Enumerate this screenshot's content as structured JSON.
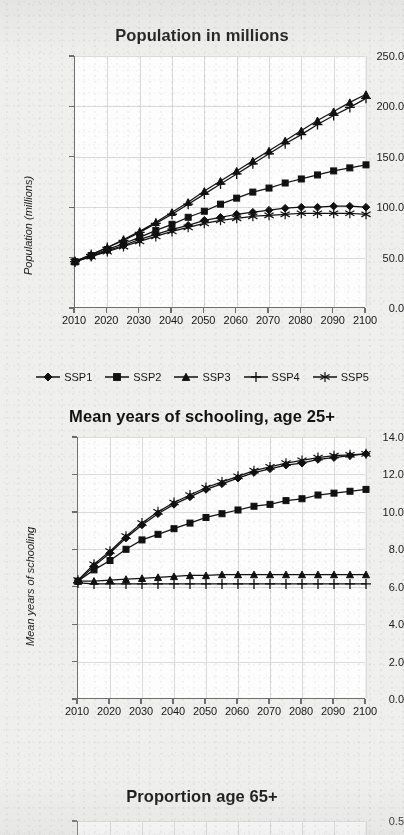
{
  "page": {
    "background_color": "#efefee",
    "panel_color": "#fdfdfd",
    "ink_color": "#111111",
    "grid_color": "#d9d9d9"
  },
  "legend": {
    "items": [
      {
        "label": "SSP1",
        "marker": "diamond"
      },
      {
        "label": "SSP2",
        "marker": "square"
      },
      {
        "label": "SSP3",
        "marker": "triangle"
      },
      {
        "label": "SSP4",
        "marker": "plus"
      },
      {
        "label": "SSP5",
        "marker": "asterisk"
      }
    ]
  },
  "chart_data": [
    {
      "type": "line",
      "title": "Population in millions",
      "xlabel": "",
      "ylabel": "Population (millions)",
      "x": [
        2010,
        2015,
        2020,
        2025,
        2030,
        2035,
        2040,
        2045,
        2050,
        2055,
        2060,
        2065,
        2070,
        2075,
        2080,
        2085,
        2090,
        2095,
        2100
      ],
      "xticklabels": [
        "2010",
        "2020",
        "2030",
        "2040",
        "2050",
        "2060",
        "2070",
        "2080",
        "2090",
        "2100"
      ],
      "xlim": [
        2010,
        2100
      ],
      "ylim": [
        0,
        250
      ],
      "yticklabels": [
        "0.0",
        "50.0",
        "100.0",
        "150.0",
        "200.0",
        "250.0"
      ],
      "yticks": [
        0,
        50,
        100,
        150,
        200,
        250
      ],
      "grid": true,
      "legend_position": "below",
      "series": [
        {
          "name": "SSP1",
          "marker": "diamond",
          "values": [
            46,
            51,
            57,
            62,
            68,
            73,
            78,
            82,
            87,
            90,
            93,
            95,
            97,
            99,
            100,
            100,
            101,
            101,
            100
          ]
        },
        {
          "name": "SSP2",
          "marker": "square",
          "values": [
            46,
            52,
            58,
            64,
            70,
            77,
            83,
            90,
            96,
            103,
            109,
            115,
            119,
            124,
            128,
            132,
            136,
            139,
            142
          ]
        },
        {
          "name": "SSP3",
          "marker": "triangle",
          "values": [
            46,
            53,
            60,
            68,
            76,
            85,
            95,
            105,
            116,
            126,
            136,
            146,
            156,
            166,
            176,
            186,
            195,
            204,
            212
          ]
        },
        {
          "name": "SSP4",
          "marker": "plus",
          "values": [
            46,
            53,
            60,
            67,
            75,
            84,
            93,
            103,
            113,
            123,
            133,
            143,
            153,
            163,
            172,
            182,
            191,
            199,
            208
          ]
        },
        {
          "name": "SSP5",
          "marker": "asterisk",
          "values": [
            46,
            51,
            56,
            61,
            66,
            71,
            76,
            80,
            84,
            87,
            89,
            91,
            92,
            93,
            94,
            94,
            94,
            94,
            93
          ]
        }
      ]
    },
    {
      "type": "line",
      "title": "Mean years of schooling, age 25+",
      "xlabel": "",
      "ylabel": "Mean years of schooling",
      "x": [
        2010,
        2015,
        2020,
        2025,
        2030,
        2035,
        2040,
        2045,
        2050,
        2055,
        2060,
        2065,
        2070,
        2075,
        2080,
        2085,
        2090,
        2095,
        2100
      ],
      "xticklabels": [
        "2010",
        "2020",
        "2030",
        "2040",
        "2050",
        "2060",
        "2070",
        "2080",
        "2090",
        "2100"
      ],
      "xlim": [
        2010,
        2100
      ],
      "ylim": [
        0,
        14
      ],
      "yticklabels": [
        "0.0",
        "2.0",
        "4.0",
        "6.0",
        "8.0",
        "10.0",
        "12.0",
        "14.0"
      ],
      "yticks": [
        0,
        2,
        4,
        6,
        8,
        10,
        12,
        14
      ],
      "grid": true,
      "series": [
        {
          "name": "SSP1",
          "marker": "diamond",
          "values": [
            6.3,
            7.1,
            7.8,
            8.6,
            9.3,
            9.9,
            10.4,
            10.8,
            11.2,
            11.5,
            11.8,
            12.1,
            12.3,
            12.5,
            12.6,
            12.8,
            12.9,
            13.0,
            13.1
          ]
        },
        {
          "name": "SSP2",
          "marker": "square",
          "values": [
            6.3,
            6.9,
            7.4,
            8.0,
            8.5,
            8.8,
            9.1,
            9.4,
            9.7,
            9.9,
            10.1,
            10.3,
            10.4,
            10.6,
            10.7,
            10.9,
            11.0,
            11.1,
            11.2
          ]
        },
        {
          "name": "SSP3",
          "marker": "triangle",
          "values": [
            6.3,
            6.3,
            6.35,
            6.4,
            6.45,
            6.5,
            6.55,
            6.6,
            6.6,
            6.65,
            6.65,
            6.65,
            6.65,
            6.65,
            6.65,
            6.65,
            6.65,
            6.65,
            6.65
          ]
        },
        {
          "name": "SSP4",
          "marker": "plus",
          "values": [
            6.2,
            6.15,
            6.15,
            6.15,
            6.15,
            6.15,
            6.15,
            6.15,
            6.15,
            6.15,
            6.15,
            6.15,
            6.15,
            6.15,
            6.15,
            6.15,
            6.15,
            6.15,
            6.15
          ]
        },
        {
          "name": "SSP5",
          "marker": "asterisk",
          "values": [
            6.35,
            7.2,
            7.9,
            8.7,
            9.4,
            10.0,
            10.5,
            10.9,
            11.3,
            11.6,
            11.9,
            12.2,
            12.4,
            12.6,
            12.75,
            12.9,
            13.0,
            13.05,
            13.1
          ]
        }
      ]
    },
    {
      "type": "line",
      "title": "Proportion age 65+",
      "xlabel": "",
      "ylabel": "",
      "ylim": [
        0,
        0.5
      ],
      "yticklabels": [
        "0.5"
      ],
      "yticks": [
        0.5
      ],
      "grid": true,
      "cropped": true,
      "series": []
    }
  ]
}
